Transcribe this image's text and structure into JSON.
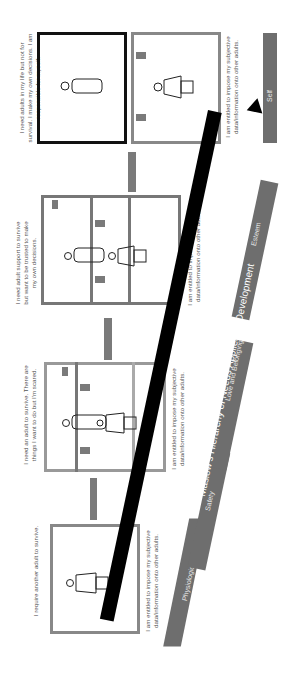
{
  "title": "Maslow's Hierarchy of Needs Applied to Development",
  "stages": [
    {
      "need": "I require another adult to survive.",
      "entitlement": "I am entitled to impose my subjective data/information onto other adults."
    },
    {
      "need": "I need an adult to survive. There are things I want to do but I'm scared.",
      "entitlement": "I am entitled to impose my subjective data/information onto other adults."
    },
    {
      "need": "I need adult support to survive but want to be trusted to make my own decisions.",
      "entitlement": "I am entitled to impose my subjective data/information onto other adults."
    },
    {
      "need": "I need adults in my life but not for survival. I make my own decisions. I am responsible for myself.",
      "entitlement": "I am entitled to impose my subjective data/information onto other adults."
    }
  ],
  "pyramid_levels": [
    "Physiological",
    "Safety",
    "Love and Belonging",
    "Esteem",
    "Self"
  ],
  "colors": {
    "step": "#6e6e6e",
    "arrow": "#7a7a7a",
    "banner": "#000000"
  }
}
